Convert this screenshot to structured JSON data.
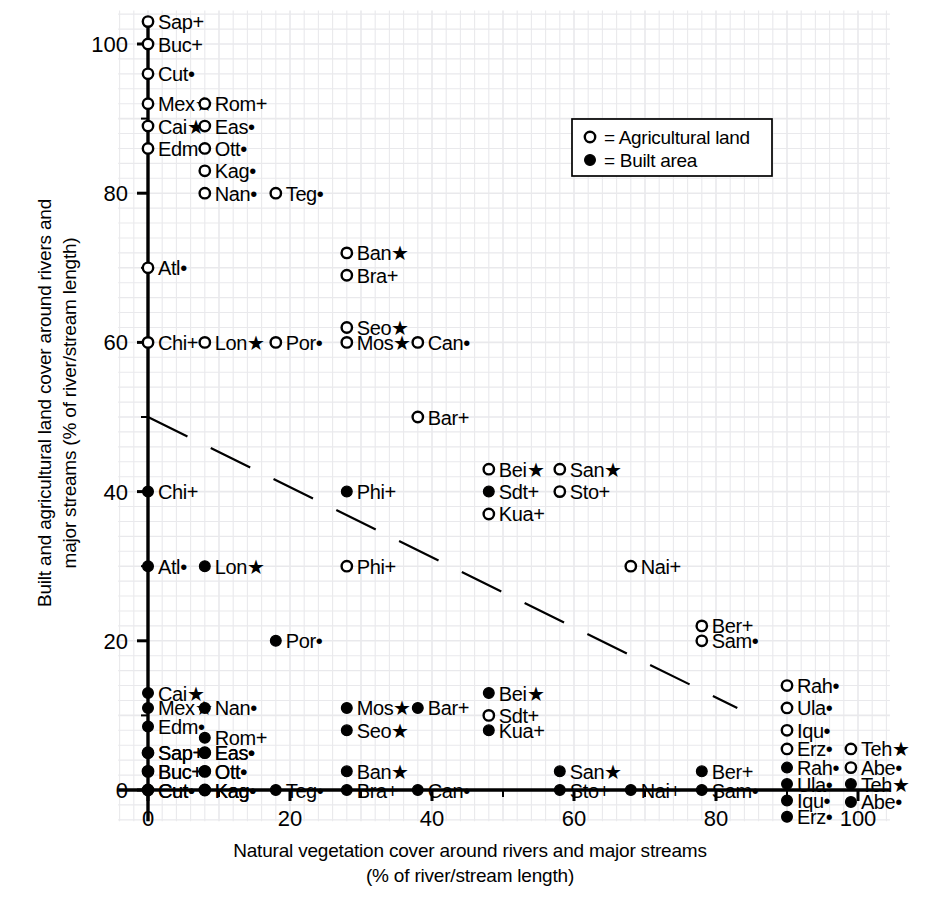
{
  "axes": {
    "x_title_line1": "Natural vegetation cover around rivers and major streams",
    "x_title_line2": "(% of river/stream length)",
    "y_title_line1": "Built and agricultural land cover around rivers and",
    "y_title_line2": "major streams (% of river/stream length)",
    "x_ticks": [
      "0",
      "20",
      "40",
      "60",
      "80",
      "100"
    ],
    "y_ticks": [
      "0",
      "20",
      "40",
      "60",
      "80",
      "100"
    ],
    "x_range": [
      -4,
      104
    ],
    "y_range": [
      -4,
      104
    ],
    "grid": true
  },
  "legend": {
    "position": "top-right",
    "entries": [
      {
        "marker": "open-circle",
        "text": "= Agricultural land"
      },
      {
        "marker": "filled-circle",
        "text": "= Built area"
      }
    ]
  },
  "trend_line": {
    "style": "dashed",
    "x0": 0,
    "y0": 50,
    "x1": 83,
    "y1": 11
  },
  "chart_data": {
    "type": "scatter",
    "title": "",
    "xlabel": "Natural vegetation cover around rivers and major streams (% of river/stream length)",
    "ylabel": "Built and agricultural land cover around rivers and major streams (% of river/stream length)",
    "xlim": [
      -4,
      104
    ],
    "ylim": [
      -4,
      104
    ],
    "grid": true,
    "legend_position": "top-right",
    "series": [
      {
        "name": "Agricultural land",
        "marker": "open-circle",
        "points": [
          {
            "label": "Sap+",
            "x": 0,
            "y": 103
          },
          {
            "label": "Buc+",
            "x": 0,
            "y": 100
          },
          {
            "label": "Cut•",
            "x": 0,
            "y": 96
          },
          {
            "label": "Mex★",
            "x": 0,
            "y": 92
          },
          {
            "label": "Cai★",
            "x": 0,
            "y": 89
          },
          {
            "label": "Edm•",
            "x": 0,
            "y": 86
          },
          {
            "label": "Rom+",
            "x": 8,
            "y": 92
          },
          {
            "label": "Eas•",
            "x": 8,
            "y": 89
          },
          {
            "label": "Ott•",
            "x": 8,
            "y": 86
          },
          {
            "label": "Kag•",
            "x": 8,
            "y": 83
          },
          {
            "label": "Nan•",
            "x": 8,
            "y": 80
          },
          {
            "label": "Teg•",
            "x": 18,
            "y": 80
          },
          {
            "label": "Ban★",
            "x": 28,
            "y": 72
          },
          {
            "label": "Bra+",
            "x": 28,
            "y": 69
          },
          {
            "label": "Atl•",
            "x": 0,
            "y": 70
          },
          {
            "label": "Seo★",
            "x": 28,
            "y": 62
          },
          {
            "label": "Chi+",
            "x": 0,
            "y": 60
          },
          {
            "label": "Lon★",
            "x": 8,
            "y": 60
          },
          {
            "label": "Por•",
            "x": 18,
            "y": 60
          },
          {
            "label": "Mos★",
            "x": 28,
            "y": 60
          },
          {
            "label": "Can•",
            "x": 38,
            "y": 60
          },
          {
            "label": "Bar+",
            "x": 38,
            "y": 50
          },
          {
            "label": "Bei★",
            "x": 48,
            "y": 43
          },
          {
            "label": "San★",
            "x": 58,
            "y": 43
          },
          {
            "label": "Sto+",
            "x": 58,
            "y": 40
          },
          {
            "label": "Kua+",
            "x": 48,
            "y": 37
          },
          {
            "label": "Phi+",
            "x": 28,
            "y": 30
          },
          {
            "label": "Nai+",
            "x": 68,
            "y": 30
          },
          {
            "label": "Ber+",
            "x": 78,
            "y": 22
          },
          {
            "label": "Sam•",
            "x": 78,
            "y": 20
          },
          {
            "label": "Rah•",
            "x": 90,
            "y": 14
          },
          {
            "label": "Ula•",
            "x": 90,
            "y": 11
          },
          {
            "label": "Iqu•",
            "x": 90,
            "y": 8
          },
          {
            "label": "Erz•",
            "x": 90,
            "y": 5.5
          },
          {
            "label": "Teh★",
            "x": 99,
            "y": 5.5
          },
          {
            "label": "Abe•",
            "x": 99,
            "y": 3
          },
          {
            "label": "Sdt+",
            "x": 48,
            "y": 10
          },
          {
            "label": "Sap+",
            "x": 0,
            "y": 5
          },
          {
            "label": "Buc+",
            "x": 0,
            "y": 2.5
          },
          {
            "label": "Cut•",
            "x": 0,
            "y": 0
          },
          {
            "label": "Eas•",
            "x": 8,
            "y": 5
          },
          {
            "label": "Ott•",
            "x": 8,
            "y": 2.5
          },
          {
            "label": "Kag•",
            "x": 8,
            "y": 0
          }
        ]
      },
      {
        "name": "Built area",
        "marker": "filled-circle",
        "points": [
          {
            "label": "Chi+",
            "x": 0,
            "y": 40
          },
          {
            "label": "Phi+",
            "x": 28,
            "y": 40
          },
          {
            "label": "Sdt+",
            "x": 48,
            "y": 40
          },
          {
            "label": "Atl•",
            "x": 0,
            "y": 30
          },
          {
            "label": "Lon★",
            "x": 8,
            "y": 30
          },
          {
            "label": "Por•",
            "x": 18,
            "y": 20
          },
          {
            "label": "Cai★",
            "x": 0,
            "y": 13
          },
          {
            "label": "Mex★",
            "x": 0,
            "y": 11
          },
          {
            "label": "Edm•",
            "x": 0,
            "y": 8.5
          },
          {
            "label": "Nan•",
            "x": 8,
            "y": 11
          },
          {
            "label": "Rom+",
            "x": 8,
            "y": 7
          },
          {
            "label": "Mos★",
            "x": 28,
            "y": 11
          },
          {
            "label": "Bar+",
            "x": 38,
            "y": 11
          },
          {
            "label": "Seo★",
            "x": 28,
            "y": 8
          },
          {
            "label": "Bei★",
            "x": 48,
            "y": 13
          },
          {
            "label": "Kua+",
            "x": 48,
            "y": 8
          },
          {
            "label": "Sap+",
            "x": 0,
            "y": 5
          },
          {
            "label": "Buc+",
            "x": 0,
            "y": 2.5
          },
          {
            "label": "Cut•",
            "x": 0,
            "y": 0
          },
          {
            "label": "Eas•",
            "x": 8,
            "y": 5
          },
          {
            "label": "Ott•",
            "x": 8,
            "y": 2.5
          },
          {
            "label": "Kag•",
            "x": 8,
            "y": 0
          },
          {
            "label": "Teg•",
            "x": 18,
            "y": 0
          },
          {
            "label": "Ban★",
            "x": 28,
            "y": 2.5
          },
          {
            "label": "Bra+",
            "x": 28,
            "y": 0
          },
          {
            "label": "Can•",
            "x": 38,
            "y": 0
          },
          {
            "label": "San★",
            "x": 58,
            "y": 2.5
          },
          {
            "label": "Sto+",
            "x": 58,
            "y": 0
          },
          {
            "label": "Nai+",
            "x": 68,
            "y": 0
          },
          {
            "label": "Ber+",
            "x": 78,
            "y": 2.5
          },
          {
            "label": "Sam•",
            "x": 78,
            "y": 0
          },
          {
            "label": "Rah•",
            "x": 90,
            "y": 3
          },
          {
            "label": "Ula•",
            "x": 90,
            "y": 0.8
          },
          {
            "label": "Iqu•",
            "x": 90,
            "y": -1.4
          },
          {
            "label": "Erz•",
            "x": 90,
            "y": -3.6
          },
          {
            "label": "Teh★",
            "x": 99,
            "y": 0.8
          },
          {
            "label": "Abe•",
            "x": 99,
            "y": -1.6
          }
        ]
      }
    ]
  },
  "colors": {
    "ink": "#000000",
    "grid": "#e9e9ec",
    "background": "#ffffff"
  }
}
